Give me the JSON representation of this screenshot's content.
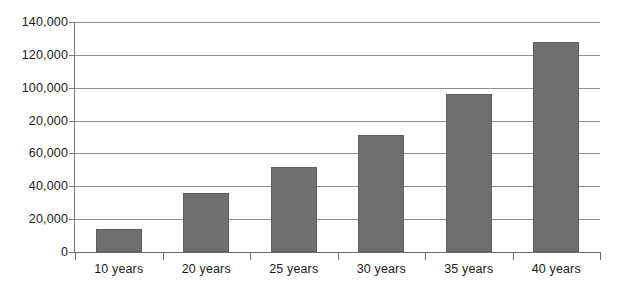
{
  "chart_data": {
    "type": "bar",
    "title": "",
    "subtitle": "",
    "xlabel": "",
    "ylabel": "",
    "categories": [
      "10 years",
      "20 years",
      "25 years",
      "30 years",
      "35 years",
      "40 years"
    ],
    "values": [
      14000,
      36000,
      52000,
      71000,
      96000,
      128000
    ],
    "series": [
      {
        "name": "",
        "values": [
          14000,
          36000,
          52000,
          71000,
          96000,
          128000
        ]
      }
    ],
    "ylim": [
      0,
      140000
    ],
    "y_ticks": [
      0,
      20000,
      40000,
      60000,
      80000,
      100000,
      120000,
      140000
    ],
    "y_tick_labels": [
      "0",
      "20,000",
      "40,000",
      "60,000",
      "20,000",
      "100,000",
      "120,000",
      "140,000"
    ],
    "grid": true,
    "grid_axis": "y",
    "legend": false,
    "legend_position": "none",
    "annotations": [],
    "bar_color": "#6f6f6f",
    "bar_border_color": "#5d5d5d",
    "grid_color": "#8e8e8e",
    "axis_color": "#6d6d6d",
    "background_color": "#ffffff",
    "text_color": "#1a1a1a"
  }
}
